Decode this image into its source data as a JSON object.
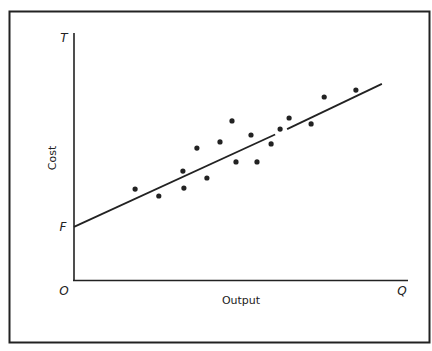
{
  "chart_data": {
    "type": "scatter",
    "title": "",
    "xlabel": "Output",
    "ylabel": "Cost",
    "xlim": [
      0,
      100
    ],
    "ylim": [
      0,
      100
    ],
    "grid": false,
    "legend": null,
    "axis_markers": {
      "origin": "O",
      "x_end": "Q",
      "y_end": "T",
      "y_intercept": "F"
    },
    "series": [
      {
        "name": "observations",
        "kind": "scatter",
        "points": [
          [
            18.3,
            36.8
          ],
          [
            25.4,
            34.0
          ],
          [
            32.6,
            44.1
          ],
          [
            32.9,
            37.2
          ],
          [
            36.8,
            53.4
          ],
          [
            39.8,
            41.3
          ],
          [
            43.7,
            55.9
          ],
          [
            47.3,
            64.4
          ],
          [
            48.5,
            47.8
          ],
          [
            53.0,
            58.7
          ],
          [
            54.8,
            47.8
          ],
          [
            59.0,
            55.1
          ],
          [
            61.7,
            61.1
          ],
          [
            64.4,
            65.6
          ],
          [
            71.0,
            63.2
          ],
          [
            74.9,
            74.1
          ],
          [
            84.4,
            76.9
          ]
        ]
      },
      {
        "name": "fitted-cost-line",
        "kind": "line",
        "points": [
          [
            0,
            21.5
          ],
          [
            92.2,
            79.4
          ]
        ],
        "gap": [
          [
            60.2,
            58.9
          ],
          [
            63.8,
            61.1
          ]
        ]
      }
    ]
  },
  "labels": {
    "ylabel": "Cost",
    "xlabel": "Output",
    "origin": "O",
    "x_end": "Q",
    "y_end": "T",
    "y_intercept": "F"
  },
  "colors": {
    "ink": "#222222",
    "background": "#ffffff"
  }
}
